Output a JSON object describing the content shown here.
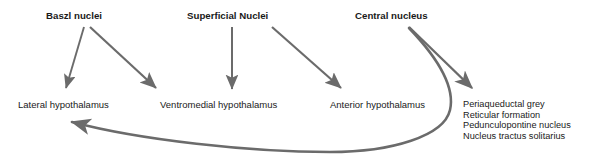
{
  "figure": {
    "type": "neuroanatomy-connectivity-diagram",
    "background_color": "#ffffff",
    "text_color": "#1a1a1a",
    "arrow_color": "#6b6b6b"
  },
  "sources": [
    {
      "id": "baszl-nuclei",
      "label": "Baszl nuclei",
      "x": 46,
      "y": 10
    },
    {
      "id": "superficial-nuclei",
      "label": "Superficial Nuclei",
      "x": 187,
      "y": 10
    },
    {
      "id": "central-nucleus",
      "label": "Central nucleus",
      "x": 355,
      "y": 10
    }
  ],
  "targets": [
    {
      "id": "lateral-hypothalamus",
      "label": "Lateral hypothalamus",
      "x": 18,
      "y": 100
    },
    {
      "id": "ventromedial-hypothalamus",
      "label": "Ventromedial hypothalamus",
      "x": 160,
      "y": 100
    },
    {
      "id": "anterior-hypothalamus",
      "label": "Anterior hypothalamus",
      "x": 330,
      "y": 100
    }
  ],
  "brainstem_list": {
    "id": "brainstem-targets",
    "x": 463,
    "y": 99,
    "items": [
      "Periaqueductal grey",
      "Reticular formation",
      "Pedunculopontine nucleus",
      "Nucleus tractus solitarius"
    ]
  },
  "connections": [
    {
      "id": "baszl-to-lateral",
      "from": "Baszl nuclei",
      "to": "Lateral hypothalamus"
    },
    {
      "id": "baszl-to-ventromedial",
      "from": "Baszl nuclei",
      "to": "Ventromedial hypothalamus"
    },
    {
      "id": "superficial-to-ventromedial",
      "from": "Superficial Nuclei",
      "to": "Ventromedial hypothalamus"
    },
    {
      "id": "superficial-to-anterior",
      "from": "Superficial Nuclei",
      "to": "Anterior hypothalamus"
    },
    {
      "id": "central-to-brainstem",
      "from": "Central nucleus",
      "to": "Periaqueductal grey"
    },
    {
      "id": "central-to-lateral-curved",
      "from": "Central nucleus",
      "to": "Lateral hypothalamus"
    }
  ]
}
